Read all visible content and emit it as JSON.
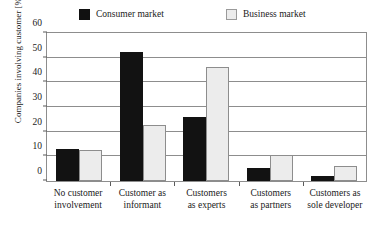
{
  "chart_data": {
    "type": "bar",
    "title": "",
    "xlabel": "",
    "ylabel": "Companies involving customer [%]",
    "ylim": [
      0,
      60
    ],
    "ytick_step": 10,
    "yticks": [
      0,
      10,
      20,
      30,
      40,
      50,
      60
    ],
    "grid": true,
    "legend_position": "top",
    "categories": [
      "No customer involvement",
      "Customer as informant",
      "Customers as experts",
      "Customers as partners",
      "Customers as sole developer"
    ],
    "category_lines": [
      [
        "No customer",
        "involvement"
      ],
      [
        "Customer as",
        "informant"
      ],
      [
        "Customers",
        "as experts"
      ],
      [
        "Customers",
        "as partners"
      ],
      [
        "Customers as",
        "sole developer"
      ]
    ],
    "series": [
      {
        "name": "Consumer market",
        "color": "#121212",
        "values": [
          12.8,
          51.5,
          25.6,
          5.4,
          2.0
        ]
      },
      {
        "name": "Business market",
        "color": "#ececec",
        "values": [
          12.5,
          22.3,
          45.8,
          10.3,
          6.1
        ]
      }
    ]
  },
  "legend": {
    "entries": [
      {
        "label": "Consumer market",
        "swatch": "filled-black-square-icon"
      },
      {
        "label": "Business market",
        "swatch": "outlined-light-square-icon"
      }
    ]
  },
  "axis": {
    "y_title": "Companies involving customer [%]",
    "y_labels": [
      "60",
      "50",
      "40",
      "30",
      "20",
      "10",
      "0"
    ]
  },
  "colors": {
    "consumer": "#121212",
    "business": "#ececec",
    "business_border": "#8d8d8d",
    "frame": "#8d8d8d",
    "grid": "#8d8d8d",
    "text": "#1a1a1a",
    "background": "#ffffff"
  }
}
